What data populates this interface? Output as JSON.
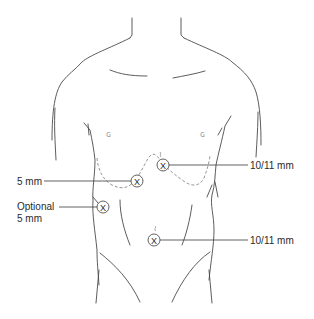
{
  "diagram": {
    "type": "anatomical-port-placement",
    "colors": {
      "line": "#4a4a4a",
      "dashed": "#8a8a8a",
      "text": "#2a2a2a",
      "background": "#ffffff"
    },
    "ports": [
      {
        "id": "port-upper-right",
        "x": 163,
        "y": 165,
        "label": "10/11 mm",
        "label_side": "right"
      },
      {
        "id": "port-left-subcostal",
        "x": 137,
        "y": 181,
        "label": "5 mm",
        "label_side": "left"
      },
      {
        "id": "port-optional-lateral",
        "x": 103,
        "y": 207,
        "label_line1": "Optional",
        "label_line2": "5 mm",
        "label_side": "left"
      },
      {
        "id": "port-umbilical",
        "x": 154,
        "y": 240,
        "label": "10/11 mm",
        "label_side": "right"
      }
    ],
    "marker_glyph": "X"
  }
}
